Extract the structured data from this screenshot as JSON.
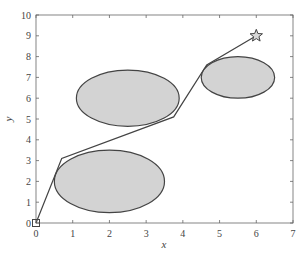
{
  "chart_data": {
    "type": "scatter",
    "title": "",
    "xlabel": "x",
    "ylabel": "y",
    "xlim": [
      0,
      7
    ],
    "ylim": [
      0,
      10
    ],
    "xticks": [
      0,
      1,
      2,
      3,
      4,
      5,
      6,
      7
    ],
    "yticks": [
      0,
      1,
      2,
      3,
      4,
      5,
      6,
      7,
      8,
      9,
      10
    ],
    "grid": false,
    "legend": null,
    "obstacles": [
      {
        "name": "obstacle-lower",
        "shape": "ellipse",
        "cx": 2.0,
        "cy": 2.0,
        "rx": 1.5,
        "ry": 1.5
      },
      {
        "name": "obstacle-middle",
        "shape": "ellipse",
        "cx": 2.5,
        "cy": 6.0,
        "rx": 1.4,
        "ry": 1.35
      },
      {
        "name": "obstacle-right",
        "shape": "ellipse",
        "cx": 5.5,
        "cy": 7.0,
        "rx": 1.0,
        "ry": 1.0
      }
    ],
    "path": {
      "x": [
        0,
        0.7,
        3.75,
        4.65,
        6.0
      ],
      "y": [
        0,
        3.1,
        5.1,
        7.6,
        9.0
      ]
    },
    "start": {
      "x": 0,
      "y": 0,
      "marker": "square"
    },
    "goal": {
      "x": 6,
      "y": 9,
      "marker": "star"
    }
  },
  "colors": {
    "obstacle_fill": "#d3d3d3",
    "obstacle_stroke": "#444444",
    "path": "#444444",
    "axis": "#666666"
  }
}
